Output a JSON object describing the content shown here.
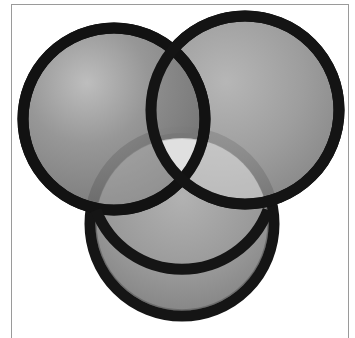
{
  "image": {
    "description": "Three overlapping circular camera lens filters with grey tinted glass and black rims",
    "background_color": "#ffffff",
    "frame_color": "#9a9a9a",
    "filters": [
      {
        "name": "top-left-filter",
        "cx": 114,
        "cy": 119,
        "r": 97,
        "rim_color": "#121212",
        "glass_color": "#8d8d8d"
      },
      {
        "name": "top-right-filter",
        "cx": 245,
        "cy": 110,
        "r": 100,
        "rim_color": "#141414",
        "glass_color": "#949494"
      },
      {
        "name": "bottom-filter",
        "cx": 182,
        "cy": 224,
        "r": 98,
        "rim_color": "#151515",
        "glass_color": "#9a9a9a"
      }
    ],
    "overlap_highlight_color": "#f4f4f4"
  }
}
